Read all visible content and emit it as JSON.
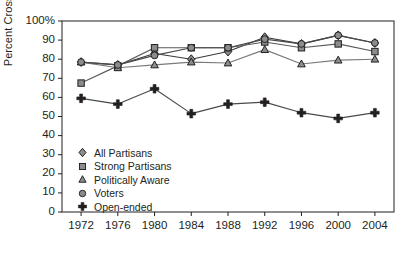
{
  "chart_data": {
    "type": "line",
    "title": "",
    "xlabel": "",
    "ylabel": "Percent Cross-pressured",
    "categories": [
      1972,
      1976,
      1980,
      1984,
      1988,
      1992,
      1996,
      2000,
      2004
    ],
    "xtick_labels": [
      "1972",
      "1976",
      "1980",
      "1984",
      "1988",
      "1992",
      "1996",
      "2000",
      "2004"
    ],
    "ytick_labels": [
      "100%",
      "90",
      "80",
      "70",
      "60",
      "50",
      "40",
      "30",
      "20",
      "10",
      "0"
    ],
    "ytick_values": [
      100,
      90,
      80,
      70,
      60,
      50,
      40,
      30,
      20,
      10,
      0
    ],
    "ylim": [
      0,
      100
    ],
    "grid": false,
    "legend_position": "lower-left-inside",
    "series": [
      {
        "name": "All Partisans",
        "marker": "diamond",
        "values": [
          78.5,
          77,
          83,
          80,
          84,
          91.5,
          88,
          92.5,
          88.5
        ]
      },
      {
        "name": "Strong Partisans",
        "marker": "square",
        "values": [
          67.5,
          76.5,
          86,
          86,
          86,
          89,
          86,
          88,
          84
        ]
      },
      {
        "name": "Politically Aware",
        "marker": "triangle",
        "values": [
          78.5,
          75.5,
          77,
          78.5,
          78,
          85,
          77.5,
          79.5,
          80
        ]
      },
      {
        "name": "Voters",
        "marker": "circle",
        "values": [
          78.5,
          77,
          82,
          86,
          86,
          90.5,
          88,
          92.5,
          88.5
        ]
      },
      {
        "name": "Open-ended",
        "marker": "plus",
        "values": [
          59.5,
          56.5,
          64.5,
          51.5,
          56.5,
          57.5,
          52,
          49,
          52
        ]
      }
    ]
  },
  "legend": {
    "items": [
      {
        "label": "All Partisans",
        "marker": "diamond"
      },
      {
        "label": "Strong Partisans",
        "marker": "square"
      },
      {
        "label": "Politically Aware",
        "marker": "triangle"
      },
      {
        "label": "Voters",
        "marker": "circle"
      },
      {
        "label": "Open-ended",
        "marker": "plus"
      }
    ]
  },
  "colors": {
    "axis": "#231f20",
    "marker_fill": "#8c8c8c",
    "marker_stroke": "#231f20",
    "line_all_partisans": "#3a3a3a",
    "line_strong_partisans": "#5a5a5a",
    "line_politically_aware": "#7a7a7a",
    "line_voters": "#4a4a4a",
    "line_open_ended": "#4a4a4a",
    "background": "#ffffff"
  }
}
